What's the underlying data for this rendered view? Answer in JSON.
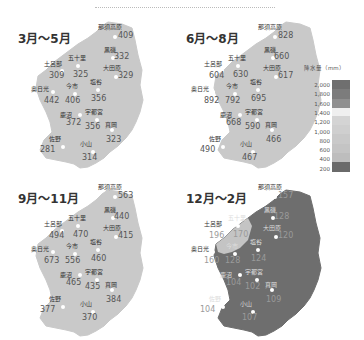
{
  "panels": [
    {
      "season": "3月～5月",
      "theme": "light",
      "stations": [
        {
          "name": "那須高原",
          "value": "409"
        },
        {
          "name": "黒磯",
          "value": "332"
        },
        {
          "name": "大田原",
          "value": "329"
        },
        {
          "name": "五十里",
          "value": "325"
        },
        {
          "name": "土呂部",
          "value": "309"
        },
        {
          "name": "奥日光",
          "value": "442"
        },
        {
          "name": "今市",
          "value": "406"
        },
        {
          "name": "塩谷",
          "value": "356"
        },
        {
          "name": "鹿沼",
          "value": "372"
        },
        {
          "name": "宇都宮",
          "value": "356"
        },
        {
          "name": "真岡",
          "value": "323"
        },
        {
          "name": "佐野",
          "value": "281"
        },
        {
          "name": "小山",
          "value": "314"
        }
      ]
    },
    {
      "season": "6月～8月",
      "theme": "light",
      "stations": [
        {
          "name": "那須高原",
          "value": "828"
        },
        {
          "name": "黒磯",
          "value": "660"
        },
        {
          "name": "大田原",
          "value": "617"
        },
        {
          "name": "五十里",
          "value": "630"
        },
        {
          "name": "土呂部",
          "value": "604"
        },
        {
          "name": "奥日光",
          "value": "892"
        },
        {
          "name": "今市",
          "value": "792"
        },
        {
          "name": "塩谷",
          "value": "695"
        },
        {
          "name": "鹿沼",
          "value": "668"
        },
        {
          "name": "宇都宮",
          "value": "590"
        },
        {
          "name": "真岡",
          "value": "466"
        },
        {
          "name": "佐野",
          "value": "490"
        },
        {
          "name": "小山",
          "value": "467"
        }
      ]
    },
    {
      "season": "9月～11月",
      "theme": "light",
      "stations": [
        {
          "name": "那須高原",
          "value": "563"
        },
        {
          "name": "黒磯",
          "value": "440"
        },
        {
          "name": "大田原",
          "value": "415"
        },
        {
          "name": "五十里",
          "value": "470"
        },
        {
          "name": "土呂部",
          "value": "494"
        },
        {
          "name": "奥日光",
          "value": "673"
        },
        {
          "name": "今市",
          "value": "556"
        },
        {
          "name": "塩谷",
          "value": "460"
        },
        {
          "name": "鹿沼",
          "value": "465"
        },
        {
          "name": "宇都宮",
          "value": "435"
        },
        {
          "name": "真岡",
          "value": "384"
        },
        {
          "name": "佐野",
          "value": "377"
        },
        {
          "name": "小山",
          "value": "370"
        }
      ]
    },
    {
      "season": "12月～2月",
      "theme": "dark",
      "stations": [
        {
          "name": "那須高原",
          "value": "157"
        },
        {
          "name": "黒磯",
          "value": "128"
        },
        {
          "name": "大田原",
          "value": "120"
        },
        {
          "name": "五十里",
          "value": "170"
        },
        {
          "name": "土呂部",
          "value": "196"
        },
        {
          "name": "奥日光",
          "value": "160"
        },
        {
          "name": "今市",
          "value": "128"
        },
        {
          "name": "塩谷",
          "value": "124"
        },
        {
          "name": "鹿沼",
          "value": "104"
        },
        {
          "name": "宇都宮",
          "value": "102"
        },
        {
          "name": "真岡",
          "value": "109"
        },
        {
          "name": "佐野",
          "value": "104"
        },
        {
          "name": "小山",
          "value": "107"
        }
      ]
    }
  ],
  "legend": {
    "title": "降水量（mm）",
    "ticks": [
      "2,000",
      "1,800",
      "1,600",
      "1,400",
      "1,200",
      "1,000",
      "800",
      "600",
      "400",
      "200"
    ],
    "colors": [
      "#6f6f6f",
      "#7c7c7c",
      "#8f8f8f",
      "#efefef",
      "#d4d4d4",
      "#cfcfcf",
      "#c9c9c9",
      "#c4c4c4",
      "#bdbdbd",
      "#6a6a6a"
    ]
  },
  "colors": {
    "map_light": "#c9c9c9",
    "map_dark": "#6e6e6e",
    "map_dark_exception": "#c4c4c4"
  }
}
